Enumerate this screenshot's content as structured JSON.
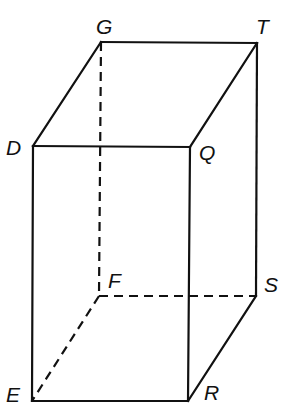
{
  "diagram": {
    "type": "rectangular-prism",
    "vertices": [
      {
        "id": "G",
        "label": "G",
        "x": 101,
        "y": 42,
        "lx": 96,
        "ly": 34
      },
      {
        "id": "T",
        "label": "T",
        "x": 257,
        "y": 43,
        "lx": 256,
        "ly": 34
      },
      {
        "id": "D",
        "label": "D",
        "x": 33,
        "y": 146,
        "lx": 6,
        "ly": 155
      },
      {
        "id": "Q",
        "label": "Q",
        "x": 190,
        "y": 147,
        "lx": 199,
        "ly": 160
      },
      {
        "id": "F",
        "label": "F",
        "x": 99,
        "y": 296,
        "lx": 108,
        "ly": 288
      },
      {
        "id": "S",
        "label": "S",
        "x": 256,
        "y": 296,
        "lx": 264,
        "ly": 292
      },
      {
        "id": "E",
        "label": "E",
        "x": 32,
        "y": 401,
        "lx": 6,
        "ly": 402
      },
      {
        "id": "R",
        "label": "R",
        "x": 188,
        "y": 401,
        "lx": 204,
        "ly": 400
      }
    ],
    "edges": [
      {
        "from": "G",
        "to": "T",
        "style": "solid"
      },
      {
        "from": "G",
        "to": "D",
        "style": "solid"
      },
      {
        "from": "T",
        "to": "Q",
        "style": "solid"
      },
      {
        "from": "D",
        "to": "Q",
        "style": "solid"
      },
      {
        "from": "D",
        "to": "E",
        "style": "solid"
      },
      {
        "from": "Q",
        "to": "R",
        "style": "solid"
      },
      {
        "from": "T",
        "to": "S",
        "style": "solid"
      },
      {
        "from": "E",
        "to": "R",
        "style": "solid"
      },
      {
        "from": "R",
        "to": "S",
        "style": "solid"
      },
      {
        "from": "G",
        "to": "F",
        "style": "dashed"
      },
      {
        "from": "F",
        "to": "S",
        "style": "dashed"
      },
      {
        "from": "F",
        "to": "E",
        "style": "dashed"
      }
    ],
    "stroke_color": "#111111"
  }
}
